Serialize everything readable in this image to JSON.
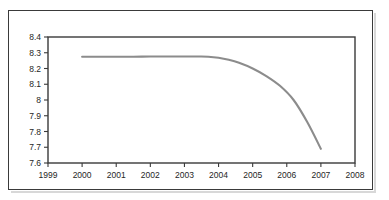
{
  "chart_data": {
    "type": "line",
    "title": "",
    "subtitle": "",
    "xlabel": "",
    "ylabel": "",
    "xlim": [
      1999,
      2008
    ],
    "ylim": [
      7.6,
      8.4
    ],
    "grid": false,
    "legend": null,
    "x_tick_labels": [
      "1999",
      "2000",
      "2001",
      "2002",
      "2003",
      "2004",
      "2005",
      "2006",
      "2007",
      "2008"
    ],
    "x_ticks": [
      1999,
      2000,
      2001,
      2002,
      2003,
      2004,
      2005,
      2006,
      2007,
      2008
    ],
    "y_tick_labels": [
      "8.4",
      "8.3",
      "8.2",
      "8.1",
      "8",
      "7.9",
      "7.8",
      "7.7",
      "7.6"
    ],
    "y_ticks": [
      8.4,
      8.3,
      8.2,
      8.1,
      8.0,
      7.9,
      7.8,
      7.7,
      7.6
    ],
    "series": [
      {
        "name": "series-1",
        "color": "#8c8c8c",
        "x": [
          2000.0,
          2000.5,
          2001.0,
          2001.5,
          2002.0,
          2002.5,
          2003.0,
          2003.4,
          2003.7,
          2004.0,
          2004.3,
          2004.6,
          2005.0,
          2005.4,
          2005.8,
          2006.2,
          2006.6,
          2007.0
        ],
        "values": [
          8.275,
          8.275,
          8.275,
          8.275,
          8.276,
          8.276,
          8.276,
          8.276,
          8.275,
          8.268,
          8.255,
          8.236,
          8.2,
          8.152,
          8.09,
          8.0,
          7.86,
          7.69
        ]
      }
    ],
    "annotations": []
  },
  "colors": {
    "line": "#8c8c8c",
    "axis": "#3a3a3a",
    "frame": "#3a3a3a",
    "background": "#ffffff",
    "tick_text": "#262626"
  }
}
